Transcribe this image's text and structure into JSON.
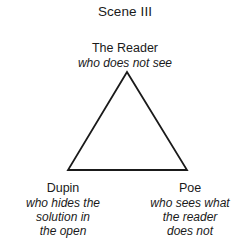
{
  "diagram": {
    "title": "Scene III",
    "type": "triangle-relationship-diagram",
    "background_color": "#ffffff",
    "stroke_color": "#1a1a1a",
    "vertices": {
      "top": {
        "name": "The Reader",
        "description_lines": [
          "who does not see"
        ],
        "description": "who does not see"
      },
      "bottom_left": {
        "name": "Dupin",
        "description_lines": [
          "who hides the",
          "solution in",
          "the open"
        ],
        "description": "who hides the solution in the open"
      },
      "bottom_right": {
        "name": "Poe",
        "description_lines": [
          "who sees what",
          "the reader",
          "does not"
        ],
        "description": "who sees what the reader does not"
      }
    },
    "shape": {
      "name": "triangle",
      "apex": [
        127,
        72
      ],
      "bottom_left": [
        68,
        170
      ],
      "bottom_right": [
        187,
        170
      ],
      "stroke_width": 1.8,
      "fill": "none"
    }
  }
}
